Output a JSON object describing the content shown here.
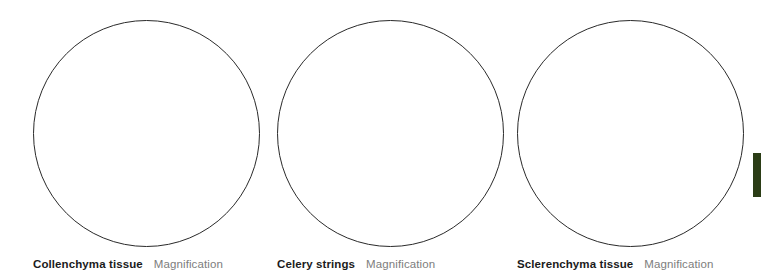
{
  "worksheet": {
    "panels": [
      {
        "specimen_name": "Collenchyma tissue",
        "magnification_label": "Magnification",
        "drawing_area": "blank-circle"
      },
      {
        "specimen_name": "Celery strings",
        "magnification_label": "Magnification",
        "drawing_area": "blank-circle"
      },
      {
        "specimen_name": "Sclerenchyma tissue",
        "magnification_label": "Magnification",
        "drawing_area": "blank-circle"
      }
    ],
    "colors": {
      "circle_outline": "#2a2a2a",
      "specimen_name_text": "#1b1b1b",
      "magnification_text": "#7d7d7d",
      "edge_marker": "#2b3d16",
      "background": "#ffffff"
    }
  }
}
